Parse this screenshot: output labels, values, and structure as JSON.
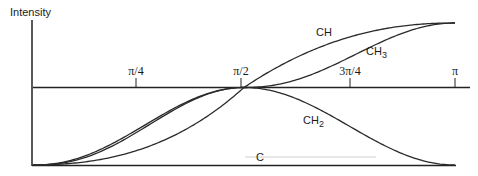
{
  "chart_data": {
    "type": "line",
    "title": "",
    "ylabel": "Intensity",
    "xlabel": "",
    "x_ticks": [
      {
        "label": "π/4",
        "value": 0.7854
      },
      {
        "label": "π/2",
        "value": 1.5708
      },
      {
        "label": "3π/4",
        "value": 2.3562
      },
      {
        "label": "π",
        "value": 3.1416
      }
    ],
    "xlim": [
      0,
      3.1416
    ],
    "ylim": [
      0,
      1
    ],
    "grid": false,
    "legend": "inline labels",
    "series": [
      {
        "name": "CH",
        "description": "rises monotonically from 0 to max, crossing mid line at π/2",
        "x": [
          0,
          0.393,
          0.785,
          1.178,
          1.571,
          1.963,
          2.356,
          2.749,
          3.1416
        ],
        "y": [
          0,
          0.06,
          0.18,
          0.36,
          0.55,
          0.74,
          0.88,
          0.97,
          1.0
        ]
      },
      {
        "name": "CH3",
        "description": "rises to mid line at π/2, flat, then rises to max at π",
        "x": [
          0,
          0.393,
          0.785,
          1.178,
          1.571,
          1.963,
          2.356,
          2.749,
          3.1416
        ],
        "y": [
          0,
          0.12,
          0.36,
          0.52,
          0.55,
          0.6,
          0.8,
          0.96,
          1.0
        ]
      },
      {
        "name": "CH2",
        "description": "rises to peak at π/2 then falls back to 0 at π",
        "x": [
          0,
          0.393,
          0.785,
          1.178,
          1.571,
          1.963,
          2.356,
          2.749,
          3.1416
        ],
        "y": [
          0,
          0.09,
          0.3,
          0.5,
          0.55,
          0.5,
          0.3,
          0.09,
          0.0
        ]
      },
      {
        "name": "C",
        "description": "flat near zero",
        "x": [
          0,
          3.1416
        ],
        "y": [
          0.06,
          0.06
        ]
      }
    ],
    "annotations": [
      "CH",
      "CH3",
      "CH2",
      "C"
    ]
  },
  "labels": {
    "ylabel": "Intensity",
    "tick_pi4": "π/4",
    "tick_pi2": "π/2",
    "tick_3pi4": "3π/4",
    "tick_pi": "π",
    "ch": "CH",
    "ch3_main": "CH",
    "ch3_sub": "3",
    "ch2_main": "CH",
    "ch2_sub": "2",
    "c": "C"
  }
}
